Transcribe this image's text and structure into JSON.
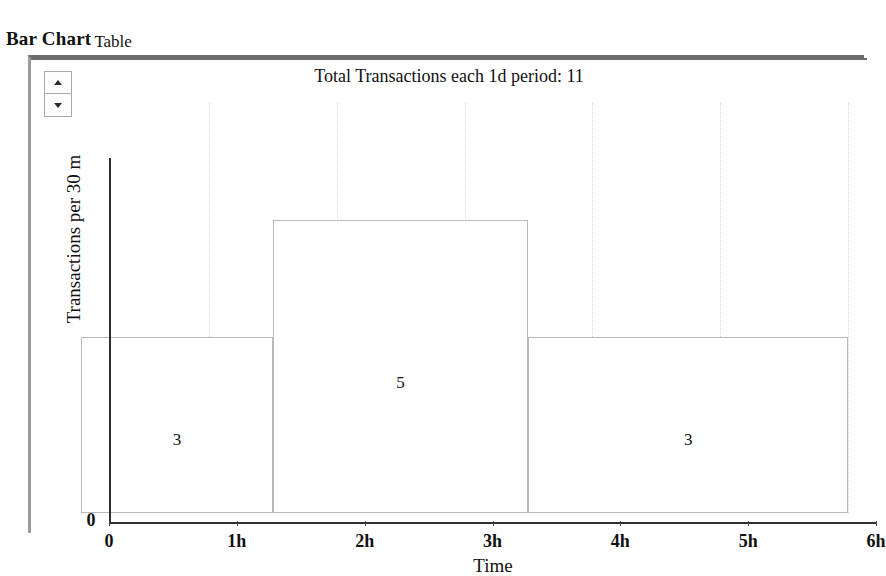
{
  "tabs": [
    {
      "label": "Bar Chart",
      "active": true
    },
    {
      "label": "Table",
      "active": false
    }
  ],
  "spinner": {
    "increment_icon": "triangle-up-icon",
    "decrement_icon": "triangle-down-icon"
  },
  "chart_data": {
    "type": "bar",
    "title": "Total Transactions each 1d period: 11",
    "xlabel": "Time",
    "ylabel": "Transactions per 30 m",
    "x_tick_labels": [
      "0",
      "1h",
      "2h",
      "3h",
      "4h",
      "5h",
      "6h"
    ],
    "x_tick_values": [
      0,
      1,
      2,
      3,
      4,
      5,
      6
    ],
    "y_tick_labels": [
      "0"
    ],
    "xlim": [
      0,
      6
    ],
    "ylim": [
      0,
      7
    ],
    "grid": "vertical-dotted",
    "legend": "none",
    "bars": [
      {
        "label": "3",
        "value": 3,
        "x_start": 0.0,
        "x_end": 1.5
      },
      {
        "label": "5",
        "value": 5,
        "x_start": 1.5,
        "x_end": 3.5
      },
      {
        "label": "3",
        "value": 3,
        "x_start": 3.5,
        "x_end": 6.0
      }
    ],
    "total": 11,
    "period": "1d",
    "bar_fill_color": "#ffffff",
    "bar_border_color": "#b9b9b9",
    "axis_color": "#2f2f2f",
    "grid_color": "#d6d6d6"
  }
}
